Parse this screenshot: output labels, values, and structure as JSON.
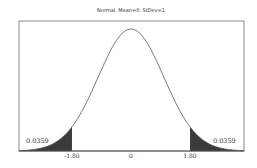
{
  "chart_data": {
    "type": "area",
    "title": "Normal, Mean=0, StDev=1",
    "distribution": "Normal",
    "mean": 0,
    "stdev": 1,
    "xlabel": "",
    "ylabel": "",
    "xlim": [
      -3.4,
      3.45
    ],
    "x_ticks": [
      "-1.80",
      "0",
      "1.80"
    ],
    "x_tick_values": [
      -1.8,
      0,
      1.8
    ],
    "shaded_regions": [
      {
        "name": "left-tail",
        "from": -3.4,
        "to": -1.8,
        "probability": "0.0359"
      },
      {
        "name": "right-tail",
        "from": 1.8,
        "to": 3.45,
        "probability": "0.0359"
      }
    ],
    "annotations": [
      "0.0359",
      "0.0359"
    ],
    "grid": false,
    "legend": null,
    "colors": {
      "curve": "#555555",
      "shade": "#3a3a3a",
      "frame": "#888888"
    }
  }
}
